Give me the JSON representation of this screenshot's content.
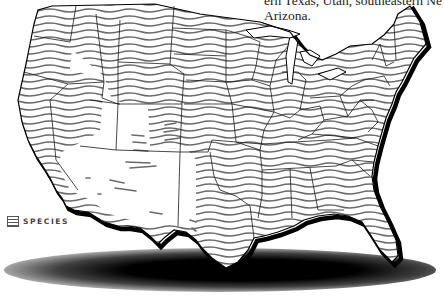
{
  "caption": {
    "line1": "ern Texas, Utah, southeastern Ne",
    "line2": "Arizona."
  },
  "legend": {
    "icon": "wavy-hatch-swatch-icon",
    "label": "SPECIES"
  },
  "map": {
    "region": "Contiguous United States",
    "fill_pattern": "horizontal wavy lines",
    "hatch_color": "#6a6a6a",
    "outline_color": "#000000",
    "state_line_color": "#1a1a1a",
    "unhatched_regions": [
      "Nevada",
      "Utah (partial)",
      "Arizona",
      "New Mexico (partial)",
      "Western Texas",
      "Southern California"
    ]
  }
}
